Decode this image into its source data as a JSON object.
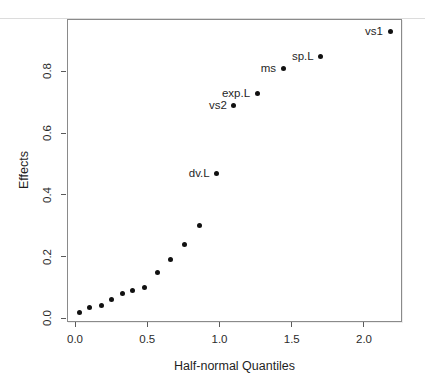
{
  "page": {
    "background": "#ffffff",
    "top_rule_color": "#dcdcdc",
    "box_border_color": "#8a8a8a",
    "tick_color": "#5a5a5a",
    "text_color": "#1f1f1f"
  },
  "chart_data": {
    "type": "scatter",
    "title": "",
    "xlabel": "Half-normal Quantiles",
    "ylabel": "Effects",
    "xlim": [
      -0.0554,
      2.263
    ],
    "ylim": [
      -0.012,
      0.97
    ],
    "x_ticks": [
      0.0,
      0.5,
      1.0,
      1.5,
      2.0
    ],
    "y_ticks": [
      0.0,
      0.2,
      0.4,
      0.6,
      0.8
    ],
    "grid": false,
    "legend_position": "none",
    "point_color": "#111111",
    "points": [
      {
        "x": 0.03,
        "y": 0.02,
        "label": ""
      },
      {
        "x": 0.1,
        "y": 0.035,
        "label": ""
      },
      {
        "x": 0.18,
        "y": 0.04,
        "label": ""
      },
      {
        "x": 0.25,
        "y": 0.06,
        "label": ""
      },
      {
        "x": 0.33,
        "y": 0.08,
        "label": ""
      },
      {
        "x": 0.4,
        "y": 0.09,
        "label": ""
      },
      {
        "x": 0.48,
        "y": 0.1,
        "label": ""
      },
      {
        "x": 0.57,
        "y": 0.15,
        "label": ""
      },
      {
        "x": 0.66,
        "y": 0.19,
        "label": ""
      },
      {
        "x": 0.76,
        "y": 0.24,
        "label": ""
      },
      {
        "x": 0.86,
        "y": 0.3,
        "label": ""
      },
      {
        "x": 0.98,
        "y": 0.47,
        "label": "dv.L"
      },
      {
        "x": 1.1,
        "y": 0.69,
        "label": "vs2"
      },
      {
        "x": 1.26,
        "y": 0.73,
        "label": "exp.L"
      },
      {
        "x": 1.44,
        "y": 0.81,
        "label": "ms"
      },
      {
        "x": 1.7,
        "y": 0.85,
        "label": "sp.L"
      },
      {
        "x": 2.18,
        "y": 0.93,
        "label": "vs1"
      }
    ]
  }
}
